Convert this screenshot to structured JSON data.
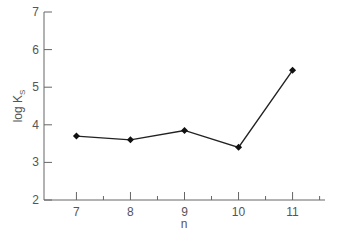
{
  "chart_data": {
    "type": "line",
    "title": "",
    "xlabel": "n",
    "ylabel": "log K_S",
    "ylabel_main": "log K",
    "ylabel_sub": "S",
    "x": [
      7,
      8,
      9,
      10,
      11
    ],
    "series": [
      {
        "name": "log K_S",
        "values": [
          3.7,
          3.6,
          3.85,
          3.4,
          5.45
        ],
        "marker": "diamond"
      }
    ],
    "xlim": [
      6.4,
      11.6
    ],
    "ylim": [
      2,
      7
    ],
    "xticks": [
      "7",
      "8",
      "9",
      "10",
      "11"
    ],
    "yticks": [
      "2",
      "3",
      "4",
      "5",
      "6",
      "7"
    ],
    "grid": false,
    "legend": null
  }
}
